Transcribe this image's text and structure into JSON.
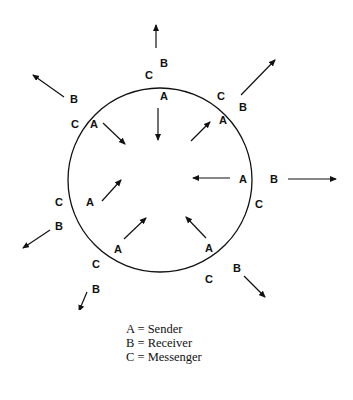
{
  "diagram": {
    "circle": {
      "cx": 160,
      "cy": 180,
      "r": 92,
      "stroke": "#111111"
    },
    "labels": {
      "A": "A",
      "B": "B",
      "C": "C"
    },
    "positions": [
      {
        "name": "top",
        "A": "A",
        "B": "B",
        "C": "C"
      },
      {
        "name": "top-right",
        "A": "A",
        "B": "B",
        "C": "C"
      },
      {
        "name": "right",
        "A": "A",
        "B": "B",
        "C": "C"
      },
      {
        "name": "bottom-right",
        "A": "A",
        "B": "B",
        "C": "C"
      },
      {
        "name": "bottom-left",
        "A": "A",
        "B": "B",
        "C": "C"
      },
      {
        "name": "left",
        "A": "A",
        "B": "B",
        "C": "C"
      },
      {
        "name": "top-left",
        "A": "A",
        "B": "B",
        "C": "C"
      }
    ]
  },
  "legend": {
    "items": [
      {
        "key": "A",
        "text": "A = Sender"
      },
      {
        "key": "B",
        "text": "B = Receiver"
      },
      {
        "key": "C",
        "text": "C = Messenger"
      }
    ]
  },
  "colors": {
    "ink": "#111111",
    "background": "#ffffff"
  }
}
